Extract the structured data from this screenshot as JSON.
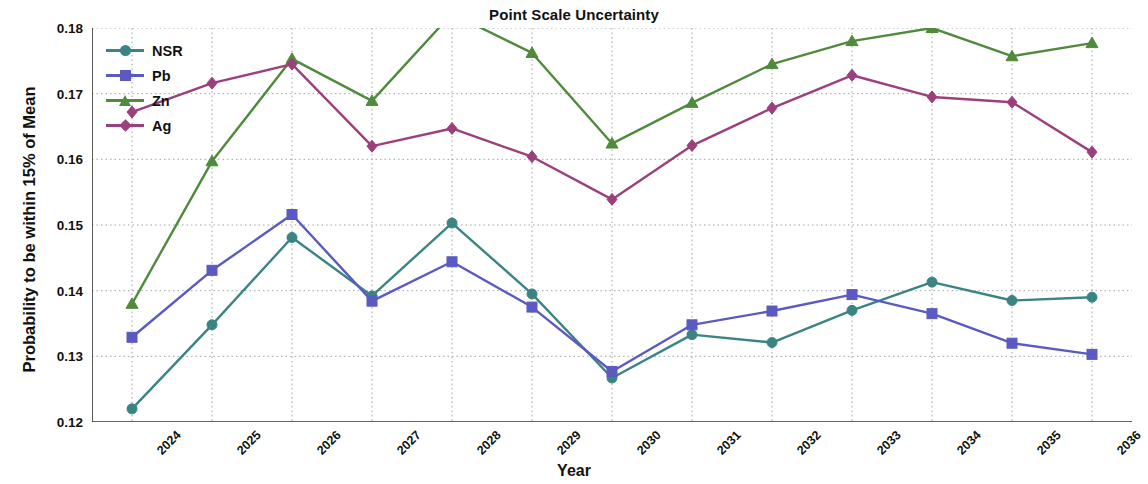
{
  "chart_data": {
    "type": "line",
    "title": "Point Scale Uncertainty",
    "xlabel": "Year",
    "ylabel": "Probability to be within 15% of Mean",
    "categories": [
      "2024",
      "2025",
      "2026",
      "2027",
      "2028",
      "2029",
      "2030",
      "2031",
      "2032",
      "2033",
      "2034",
      "2035",
      "2036"
    ],
    "x": [
      2024,
      2025,
      2026,
      2027,
      2028,
      2029,
      2030,
      2031,
      2032,
      2033,
      2034,
      2035,
      2036
    ],
    "ylim": [
      0.12,
      0.18
    ],
    "yticks": [
      "0.12",
      "0.13",
      "0.14",
      "0.15",
      "0.16",
      "0.17",
      "0.18"
    ],
    "ytick_values": [
      0.12,
      0.13,
      0.14,
      0.15,
      0.16,
      0.17,
      0.18
    ],
    "grid": true,
    "legend_position": "top-left",
    "series": [
      {
        "name": "NSR",
        "color": "#3b8484",
        "marker": "circle",
        "values": [
          0.122,
          0.1348,
          0.1481,
          0.1392,
          0.1503,
          0.1395,
          0.1267,
          0.1333,
          0.1321,
          0.137,
          0.1413,
          0.1385,
          0.139
        ]
      },
      {
        "name": "Pb",
        "color": "#5a5ac2",
        "marker": "square",
        "values": [
          0.1329,
          0.1431,
          0.1516,
          0.1384,
          0.1444,
          0.1375,
          0.1277,
          0.1348,
          0.1369,
          0.1394,
          0.1365,
          0.132,
          0.1303
        ]
      },
      {
        "name": "Zn",
        "color": "#4f8a3d",
        "marker": "triangle",
        "values": [
          0.138,
          0.1597,
          0.1753,
          0.1689,
          0.1822,
          0.1762,
          0.1624,
          0.1686,
          0.1745,
          0.178,
          0.18,
          0.1757,
          0.1777
        ]
      },
      {
        "name": "Ag",
        "color": "#9c3f7d",
        "marker": "diamond",
        "values": [
          0.1672,
          0.1716,
          0.1745,
          0.162,
          0.1647,
          0.1604,
          0.1539,
          0.1621,
          0.1678,
          0.1728,
          0.1695,
          0.1687,
          0.1611
        ]
      }
    ]
  }
}
